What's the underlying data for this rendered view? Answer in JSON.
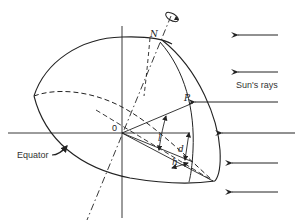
{
  "diagram": {
    "type": "celestial-sphere-sun-angle",
    "labels": {
      "north_pole": "N",
      "point": "P",
      "origin": "0",
      "latitude": "l",
      "declination": "d",
      "hour_angle": "h",
      "equator": "Equator",
      "sun_rays": "Sun's rays"
    },
    "colors": {
      "stroke": "#222222",
      "background": "#ffffff"
    }
  }
}
